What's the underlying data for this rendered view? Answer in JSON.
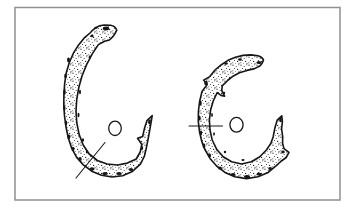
{
  "meta": {
    "figure_type": "archaeological line drawing",
    "artifact_count": 2
  },
  "colors": {
    "background": "#ffffff",
    "paper": "#ffffff",
    "frame": "#909090",
    "ink": "#161616"
  },
  "frame": {
    "x": 15,
    "y": 7.5,
    "width": 325,
    "height": 192.5,
    "stroke_width": 1.5
  },
  "artifacts": [
    {
      "name": "left-artifact",
      "description": "Larger C-shaped stippled object opening to the right; top end bends rightward into a knob, lower-right end rises to a jagged barbed point; diagonal section line across the lower-left band; small oval hole marker in the centre opening.",
      "outline_path": "M116.8,30.2 Q115.4,26.2 110.6,25.3 L104,25 Q99.2,25.3 96.4,27.3 L93,29.8 Q91.2,31.2 90.6,32.5 L84,38.2 L78.4,45.2 L73.4,53.2 L69.4,62.2 L66.4,72.2 L64.7,83 L63.9,94 L63.8,105 L64.5,116 L66,127 L68.3,138 L71.7,148.2 L76.5,157.2 L83.3,164.9 L91.7,171.2 L101.5,175.3 L112,177 L122.6,175.7 L132.4,171.5 L140.4,164.2 L144.4,156.2 L146.5,147.2 L148.3,138 L150,128.6 L151.4,120.6 L152.2,115.6 L147,120.6 L144.4,128.6 L142.6,136.6 L137.6,138.3 L141.8,144.5 L140.2,152 L136.2,159 L127.4,163.1 L117.6,165 L107,164 L97.4,160.5 L89.2,154 L83.2,145 L79.2,134.6 L76.8,123 L76,111 L76.8,99 L78.8,87.5 L82,76 L86.6,64.6 L92.4,53.6 L98.4,44.6 L104.6,41.3 L108.8,40.3 Q113.6,37.2 116.8,30.2 Z",
      "blotches_path": "M106,28.5 m-3.2,0 a3.2,1.9 0 1 0 6.4,0 a3.2,1.9 0 1 0 -6.4,0 Z M96,27.8 m-1.8,0 a1.8,1 0 1 0 3.6,0 a1.8,1 0 1 0 -3.6,0 Z M92,36 m-1.6,0 a1.6,1.2 0 1 0 3.2,0 a1.6,1.2 0 1 0 -3.2,0 Z M68.5,60 m-1.5,0 a1.5,2.4 0 1 0 3,0 a1.5,2.4 0 1 0 -3,0 Z M65.5,76 m-1.3,0 a1.3,2.6 0 1 0 2.6,0 a1.3,2.6 0 1 0 -2.6,0 Z M64.5,92 m-1.3,0 a1.3,2.8 0 1 0 2.6,0 a1.3,2.8 0 1 0 -2.6,0 Z M64.3,108 m-1.2,0 a1.2,2.6 0 1 0 2.4,0 a1.2,2.6 0 1 0 -2.4,0 Z M66,123 m-1.3,0 a1.3,2.4 0 1 0 2.6,0 a1.3,2.4 0 1 0 -2.6,0 Z M68.8,137 m-1.4,0 a1.4,2.4 0 1 0 2.8,0 a1.4,2.4 0 1 0 -2.8,0 Z M73,149 m-1.5,0 a1.5,2.2 0 1 0 3,0 a1.5,2.2 0 1 0 -3,0 Z M80,159 m-1.7,0 a1.7,2 0 1 0 3.4,0 a1.7,2 0 1 0 -3.4,0 Z M92,169 m-2.4,0 a2.4,1.7 0 1 0 4.8,0 a2.4,1.7 0 1 0 -4.8,0 Z M105,173.5 m-2.8,0 a2.8,1.6 0 1 0 5.6,0 a2.8,1.6 0 1 0 -5.6,0 Z M119,173.5 m-2.8,0 a2.8,1.5 0 1 0 5.6,0 a2.8,1.5 0 1 0 -5.6,0 Z M131,169.5 m-2.2,0 a2.2,1.5 0 1 0 4.4,0 a2.2,1.5 0 1 0 -4.4,0 Z M149.5,122 m-1.4,0 a1.4,2.4 0 1 0 2.8,0 a1.4,2.4 0 1 0 -2.8,0 Z M142,148 m-1.2,0 a1.2,2 0 1 0 2.4,0 a1.2,2 0 1 0 -2.4,0 Z M80,92 m-1,0 a1,2.2 0 1 0 2,0 a1,2.2 0 1 0 -2,0 Z M78.5,115 m-1,0 a1,2.2 0 1 0 2,0 a1,2.2 0 1 0 -2,0 Z M83,140 m-1.1,0 a1.1,1.8 0 1 0 2.2,0 a1.1,1.8 0 1 0 -2.2,0 Z M90,57 m-1,0 a1,1.8 0 1 0 2,0 a1,1.8 0 1 0 -2,0 Z M87,152 m-1.2,0 a1.2,1.4 0 1 0 2.4,0 a1.2,1.4 0 1 0 -2.4,0 Z",
      "hole": {
        "cx": 115,
        "cy": 128.3,
        "rx": 6.3,
        "ry": 7.2
      },
      "section_line": {
        "x1": 76,
        "y1": 178,
        "x2": 105,
        "y2": 142.5
      }
    },
    {
      "name": "right-artifact",
      "description": "Slightly smaller C-shaped stippled object; top end extends right as a near-horizontal pointed limb, lower-right end rises to a narrow tip with a rightward barb below it; horizontal section line crossing the left band beside the central oval hole marker.",
      "outline_path": "M263.5,60 Q262.2,56.8 258,55.8 L251,54.9 L243,55.4 L235.4,57.3 L228,60.3 L221.4,64.6 L215,70 L209.8,76.6 L203.6,80.1 L207.2,84.6 L202,91.4 L199.6,101.5 L198.4,111.5 L198.3,121.7 L199.5,131.7 L201.8,141.6 L205.2,150.2 L210,158.4 L216.6,166 L225,172.4 L234.8,176.8 L246.4,178.6 L258,176.8 L268.2,172.4 L276,165.8 L281.4,161 L286.2,157.5 L289,152.4 L284,148.6 L282.6,143.5 L282.7,136.5 L281.6,129 L282.4,121.5 L281.8,115.8 L277.2,120.2 L274.8,128.3 L273.2,136.7 L270.8,143.4 L266.4,150 L259.8,156.7 L251.4,161.7 L241.6,164 L231.6,161.7 L223.2,156.7 L216.6,149.2 L212.2,140 L210,130 L209.4,120 L210.6,110 L213.2,101 L217.2,92.7 L221,95.4 L224.6,96.2 L221.8,90.6 L222.2,85.8 L228.2,80 L233,76.2 L239.4,72.8 L247,70.4 L254.6,68.6 L259.8,66 Q262.6,63.4 263.5,60 Z",
      "blotches_path": "M259,62.5 m-2.4,0 a2.4,1.5 0 1 0 4.8,0 a2.4,1.5 0 1 0 -4.8,0 Z M240,59.5 m-2,0 a2,1.2 0 1 0 4,0 a2,1.2 0 1 0 -4,0 Z M226,63.5 m-1.8,0 a1.8,1.2 0 1 0 3.6,0 a1.8,1.2 0 1 0 -3.6,0 Z M206,83 m-1.8,0 a1.8,2.2 0 1 0 3.6,0 a1.8,2.2 0 1 0 -3.6,0 Z M200.5,103 m-1.2,0 a1.2,2.4 0 1 0 2.4,0 a1.2,2.4 0 1 0 -2.4,0 Z M199.5,118 m-1.2,0 a1.2,2.6 0 1 0 2.4,0 a1.2,2.6 0 1 0 -2.4,0 Z M201,133 m-1.2,0 a1.2,2.4 0 1 0 2.4,0 a1.2,2.4 0 1 0 -2.4,0 Z M204,146 m-1.4,0 a1.4,2.4 0 1 0 2.8,0 a1.4,2.4 0 1 0 -2.8,0 Z M209.5,155.5 m-1.5,0 a1.5,2 0 1 0 3,0 a1.5,2 0 1 0 -3,0 Z M220,168 m-2,0 a2,1.6 0 1 0 4,0 a2,1.6 0 1 0 -4,0 Z M233,174.5 m-2.6,0 a2.6,1.6 0 1 0 5.2,0 a2.6,1.6 0 1 0 -5.2,0 Z M247,176.5 m-3,0 a3,1.5 0 1 0 6,0 a3,1.5 0 1 0 -6,0 Z M259,174 m-2.4,0 a2.4,1.5 0 1 0 4.8,0 a2.4,1.5 0 1 0 -4.8,0 Z M270,168.5 m-1.8,0 a1.8,1.6 0 1 0 3.6,0 a1.8,1.6 0 1 0 -3.6,0 Z M280.5,120 m-1.3,0 a1.3,2.2 0 1 0 2.6,0 a1.3,2.2 0 1 0 -2.6,0 Z M283,152 m-1.8,0 a1.8,1.4 0 1 0 3.6,0 a1.8,1.4 0 1 0 -3.6,0 Z M212,115 m-0.9,0 a0.9,2 0 1 0 1.8,0 a0.9,2 0 1 0 -1.8,0 Z M214,134 m-0.9,0 a0.9,1.8 0 1 0 1.8,0 a0.9,1.8 0 1 0 -1.8,0 Z M225,152 m-1.2,0 a1.2,1.2 0 1 0 2.4,0 a1.2,1.2 0 1 0 -2.4,0 Z M243,160 m-1.6,0 a1.6,1 0 1 0 3.2,0 a1.6,1 0 1 0 -3.2,0 Z M224,93 m-1.2,0 a1.2,1.2 0 1 0 2.4,0 a1.2,1.2 0 1 0 -2.4,0 Z",
      "hole": {
        "cx": 236.5,
        "cy": 124.8,
        "rx": 6.6,
        "ry": 7.4
      },
      "section_line": {
        "x1": 189,
        "y1": 126,
        "x2": 222.5,
        "y2": 126
      }
    }
  ]
}
